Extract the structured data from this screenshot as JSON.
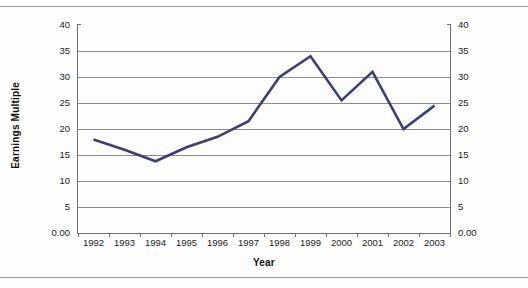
{
  "figure": {
    "background_color": "#fdfdfc",
    "rule_color": "#9a9a9a",
    "ytitle": "Earnings Multiple",
    "xtitle": "Year"
  },
  "chart_data": {
    "type": "line",
    "title": "",
    "xlabel": "Year",
    "ylabel": "Earnings Multiple",
    "categories": [
      "1992",
      "1993",
      "1994",
      "1995",
      "1996",
      "1997",
      "1998",
      "1999",
      "2000",
      "2001",
      "2002",
      "2003"
    ],
    "values": [
      18.0,
      16.0,
      13.8,
      16.5,
      18.5,
      21.5,
      30.0,
      34.0,
      25.5,
      31.0,
      20.0,
      24.5
    ],
    "series": [
      {
        "name": "Earnings Multiple",
        "color": "#3b3f78",
        "values": [
          18.0,
          16.0,
          13.8,
          16.5,
          18.5,
          21.5,
          30.0,
          34.0,
          25.5,
          31.0,
          20.0,
          24.5
        ]
      }
    ],
    "ylim": [
      0,
      40
    ],
    "ytick_labels_left": [
      "40",
      "35",
      "30",
      "25",
      "20",
      "15",
      "10",
      "5",
      "0.00"
    ],
    "ytick_labels_right": [
      "40",
      "35",
      "30",
      "25",
      "20",
      "15",
      "10",
      "5",
      "0.00"
    ],
    "ytick_values": [
      40,
      35,
      30,
      25,
      20,
      15,
      10,
      5,
      0
    ],
    "grid": true,
    "grid_color": "#8c8c8c",
    "legend": false,
    "legend_position": "none",
    "dual_axis": true,
    "markers": false,
    "line_width_px": 2.6
  }
}
